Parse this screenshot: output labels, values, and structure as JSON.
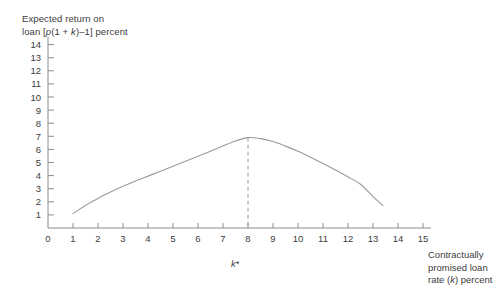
{
  "chart_data": {
    "type": "line",
    "title": "",
    "subtitle": "",
    "ylabel_line1": "Expected return on",
    "ylabel_line2_pre": "loan [",
    "ylabel_p": "p",
    "ylabel_mid": "(1 + ",
    "ylabel_k": "k",
    "ylabel_post": ")–1] percent",
    "xlabel_line1": "Contractually",
    "xlabel_line2": "promised loan",
    "xlabel_line3_pre": "rate (",
    "xlabel_k": "k",
    "xlabel_line3_post": ") percent",
    "xticks": [
      0,
      1,
      2,
      3,
      4,
      5,
      6,
      7,
      8,
      9,
      10,
      11,
      12,
      13,
      14,
      15
    ],
    "yticks": [
      1,
      2,
      3,
      4,
      5,
      6,
      7,
      8,
      9,
      10,
      11,
      12,
      13,
      14
    ],
    "xlim": [
      0,
      15
    ],
    "ylim": [
      0,
      14.5
    ],
    "grid": false,
    "legend": false,
    "curve_color": "#9a9a9a",
    "axis_color": "#8c8c8c",
    "text_color": "#3c3c3c",
    "annotations": [
      {
        "name": "k-star-marker",
        "label_k": "k",
        "label_star": "*",
        "x": 8,
        "y": 6.9,
        "style": "dashed-vertical-line"
      }
    ],
    "x": [
      1.0,
      1.25,
      1.5,
      1.75,
      2.0,
      2.5,
      3.0,
      3.5,
      4.0,
      4.5,
      5.0,
      5.5,
      6.0,
      6.5,
      7.0,
      7.5,
      8.0,
      8.5,
      9.0,
      9.5,
      10.0,
      10.5,
      11.0,
      11.5,
      12.0,
      12.5,
      13.0,
      13.4
    ],
    "y": [
      1.1,
      1.42,
      1.72,
      2.0,
      2.26,
      2.74,
      3.18,
      3.58,
      3.96,
      4.34,
      4.72,
      5.1,
      5.48,
      5.86,
      6.26,
      6.64,
      6.9,
      6.82,
      6.6,
      6.25,
      5.85,
      5.4,
      4.92,
      4.42,
      3.9,
      3.34,
      2.4,
      1.72
    ]
  }
}
